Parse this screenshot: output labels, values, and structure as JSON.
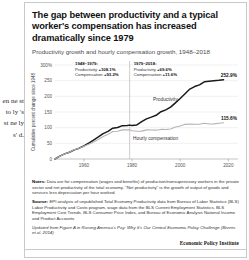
{
  "background_text": "en ne st to ly 's st ne ly s' d.",
  "card": {
    "title": "The gap between productivity and a typical worker's compensation has increased dramatically since 1979",
    "subtitle": "Productivity growth and hourly compensation growth, 1948–2018",
    "notes": {
      "notes_label": "Notes:",
      "notes_text": " Data are for compensation (wages and benefits) of production/nonsupervisory workers in the private sector and net productivity of the total economy. \"Net productivity\" is the growth of output of goods and services less depreciation per hour worked.",
      "source_label": "Source:",
      "source_text": " EPI analysis of unpublished Total Economy Productivity data from Bureau of Labor Statistics (BLS) Labor Productivity and Costs program, wage data from the BLS Current Employment Statistics, BLS Employment Cost Trends, BLS Consumer Price Index, and Bureau of Economic Analysis National Income and Product Accounts",
      "updated_text": "Updated from Figure A in Raising America's Pay: Why It's Our Central Economic Policy Challenge (Bivens et al. 2014)"
    },
    "attribution": "Economic Policy Institute"
  },
  "chart_data": {
    "type": "line",
    "title": "Productivity growth and hourly compensation growth, 1948–2018",
    "xlabel": "",
    "ylabel": "Cumulative percent change since 1948",
    "xlim": [
      1948,
      2024
    ],
    "ylim": [
      0,
      300
    ],
    "yticks": [
      "300%",
      "250",
      "200",
      "150",
      "100",
      "50",
      "0"
    ],
    "ytick_values": [
      300,
      250,
      200,
      150,
      100,
      50,
      0
    ],
    "xticks": [
      "1960",
      "1980",
      "2000",
      "2020"
    ],
    "xtick_values": [
      1960,
      1980,
      2000,
      2020
    ],
    "grid": true,
    "legend": "inline-labels",
    "divider_year": 1979,
    "annotations": [
      {
        "name": "period-1948-1979",
        "heading": "1948–1979:",
        "rows": [
          {
            "label": "Productivity ",
            "value": "+108.1%"
          },
          {
            "label": "Compensation ",
            "value": "+93.2%"
          }
        ]
      },
      {
        "name": "period-1979-2018",
        "heading": "1979–2018:",
        "rows": [
          {
            "label": "Productivity ",
            "value": "+69.6%"
          },
          {
            "label": "Compensation ",
            "value": "+11.6%"
          }
        ]
      }
    ],
    "endpoint_labels": [
      {
        "series": "Productivity",
        "value": "252.9%"
      },
      {
        "series": "Hourly compensation",
        "value": "115.6%"
      }
    ],
    "series": [
      {
        "name": "Productivity",
        "label": "Productivity",
        "color": "#1a1a1a",
        "x": [
          1948,
          1950,
          1952,
          1954,
          1956,
          1958,
          1960,
          1962,
          1964,
          1966,
          1968,
          1970,
          1972,
          1974,
          1976,
          1978,
          1979,
          1980,
          1982,
          1984,
          1986,
          1988,
          1990,
          1992,
          1994,
          1996,
          1998,
          2000,
          2002,
          2004,
          2006,
          2008,
          2010,
          2012,
          2014,
          2016,
          2018
        ],
        "values": [
          0,
          9.3,
          16.4,
          21.6,
          29.2,
          34.5,
          41.6,
          50.6,
          60.5,
          70.4,
          81.0,
          88.1,
          98.2,
          100.4,
          106.5,
          107.0,
          108.1,
          106.6,
          108.8,
          119.2,
          128.1,
          133.8,
          139.5,
          151.0,
          156.7,
          165.4,
          179.2,
          192.9,
          208.1,
          223.2,
          231.2,
          236.6,
          246.4,
          248.0,
          249.5,
          251.0,
          252.9
        ]
      },
      {
        "name": "Hourly compensation",
        "label": "Hourly compensation",
        "color": "#b3b3b3",
        "x": [
          1948,
          1950,
          1952,
          1954,
          1956,
          1958,
          1960,
          1962,
          1964,
          1966,
          1968,
          1970,
          1972,
          1974,
          1976,
          1978,
          1979,
          1980,
          1982,
          1984,
          1986,
          1988,
          1990,
          1992,
          1994,
          1996,
          1998,
          2000,
          2002,
          2004,
          2006,
          2008,
          2010,
          2012,
          2014,
          2016,
          2018
        ],
        "values": [
          0,
          8.7,
          16.0,
          21.4,
          30.0,
          34.6,
          40.6,
          47.1,
          54.6,
          62.2,
          71.8,
          78.6,
          88.0,
          88.5,
          92.9,
          93.0,
          93.2,
          90.3,
          88.5,
          88.9,
          93.0,
          92.6,
          92.0,
          94.4,
          94.0,
          95.7,
          101.9,
          105.5,
          110.6,
          111.9,
          110.9,
          110.7,
          114.2,
          111.8,
          112.2,
          114.0,
          115.6
        ]
      }
    ]
  }
}
